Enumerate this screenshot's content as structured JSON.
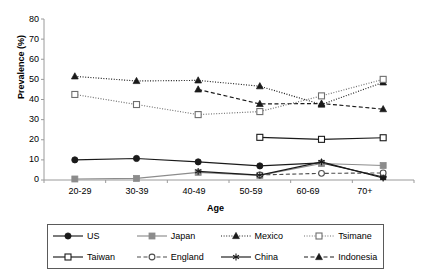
{
  "chart_data": {
    "type": "line",
    "title": "",
    "xlabel": "Age",
    "ylabel": "Prevalence (%)",
    "categories": [
      "20-29",
      "30-39",
      "40-49",
      "50-59",
      "60-69",
      "70+"
    ],
    "ylim": [
      0,
      80
    ],
    "yticks": [
      0,
      10,
      20,
      30,
      40,
      50,
      60,
      70,
      80
    ],
    "grid": false,
    "legend_position": "bottom",
    "series": [
      {
        "name": "US",
        "values": [
          10.0,
          10.7,
          9.0,
          7.0,
          8.5,
          1.5
        ],
        "marker": "filled-circle",
        "line": "solid",
        "color": "#1a1a1a"
      },
      {
        "name": "Japan",
        "values": [
          0.5,
          0.8,
          3.8,
          2.3,
          8.2,
          7.2
        ],
        "marker": "filled-square",
        "line": "solid",
        "color": "#8c8c8c"
      },
      {
        "name": "Mexico",
        "values": [
          51.5,
          49.2,
          49.5,
          46.6,
          37.5,
          48.5
        ],
        "marker": "filled-triangle",
        "line": "dotted",
        "color": "#1a1a1a"
      },
      {
        "name": "Tsimane",
        "values": [
          42.5,
          37.5,
          32.5,
          34.0,
          41.8,
          50.0
        ],
        "marker": "open-square",
        "line": "dotted",
        "color": "#6e6e6e"
      },
      {
        "name": "Taiwan",
        "values": [
          null,
          null,
          null,
          21.2,
          20.2,
          21.0
        ],
        "marker": "open-square",
        "line": "solid",
        "color": "#1a1a1a"
      },
      {
        "name": "England",
        "values": [
          null,
          null,
          null,
          2.5,
          3.3,
          3.5
        ],
        "marker": "open-circle",
        "line": "dashed",
        "color": "#4d4d4d"
      },
      {
        "name": "China",
        "values": [
          null,
          null,
          4.3,
          2.4,
          9.0,
          1.0
        ],
        "marker": "asterisk",
        "line": "solid",
        "color": "#1a1a1a"
      },
      {
        "name": "Indonesia",
        "values": [
          null,
          null,
          45.0,
          37.8,
          38.0,
          35.2
        ],
        "marker": "filled-triangle",
        "line": "dashed",
        "color": "#1a1a1a"
      }
    ]
  },
  "legend": {
    "items": [
      {
        "label": "US"
      },
      {
        "label": "Japan"
      },
      {
        "label": "Mexico"
      },
      {
        "label": "Tsimane"
      },
      {
        "label": "Taiwan"
      },
      {
        "label": "England"
      },
      {
        "label": "China"
      },
      {
        "label": "Indonesia"
      }
    ]
  },
  "axes": {
    "y_title": "Prevalence (%)",
    "x_title": "Age",
    "yticks": [
      "80",
      "70",
      "60",
      "50",
      "40",
      "30",
      "20",
      "10",
      "0"
    ],
    "xticks": [
      "20-29",
      "30-39",
      "40-49",
      "50-59",
      "60-69",
      "70+"
    ]
  }
}
